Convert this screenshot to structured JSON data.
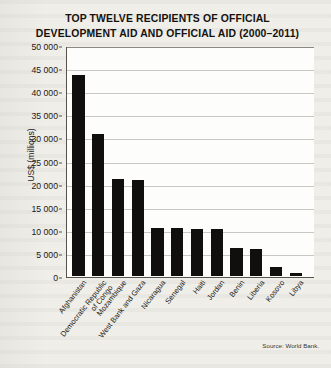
{
  "figure": {
    "title_line1": "TOP TWELVE RECIPIENTS OF OFFICIAL",
    "title_line2": "DEVELOPMENT AID AND OFFICIAL AID (2000–2011)",
    "source": "Source: World Bank."
  },
  "chart_data": {
    "type": "bar",
    "title": "TOP TWELVE RECIPIENTS OF OFFICIAL DEVELOPMENT AID AND OFFICIAL AID (2000–2011)",
    "xlabel": "",
    "ylabel": "US$ (millions)",
    "ylim": [
      0,
      50000
    ],
    "ytick_step": 5000,
    "ytick_labels": [
      "0",
      "5 000",
      "10 000",
      "15 000",
      "20 000",
      "25 000",
      "30 000",
      "35 000",
      "40 000",
      "45 000",
      "50 000"
    ],
    "ytick_values": [
      0,
      5000,
      10000,
      15000,
      20000,
      25000,
      30000,
      35000,
      40000,
      45000,
      50000
    ],
    "grid": true,
    "legend": false,
    "categories": [
      "Afghanistan",
      "Democratic Republic of Congo",
      "Mozambique",
      "West Bank and Gaza",
      "Nicaragua",
      "Senegal",
      "Haiti",
      "Jordan",
      "Benin",
      "Liberia",
      "Kosovo",
      "Libya"
    ],
    "category_lines": [
      [
        "Afghanistan"
      ],
      [
        "Democratic Republic",
        "of Congo"
      ],
      [
        "Mozambique"
      ],
      [
        "West Bank and Gaza"
      ],
      [
        "Nicaragua"
      ],
      [
        "Senegal"
      ],
      [
        "Haiti"
      ],
      [
        "Jordan"
      ],
      [
        "Benin"
      ],
      [
        "Liberia"
      ],
      [
        "Kosovo"
      ],
      [
        "Libya"
      ]
    ],
    "values": [
      43500,
      30700,
      21000,
      20800,
      10500,
      10300,
      10100,
      10100,
      6000,
      5800,
      2000,
      700
    ],
    "bar_color": "#100f0d",
    "plot_background": "#fdfdfb",
    "gridline_color": "#c9c7c1"
  }
}
